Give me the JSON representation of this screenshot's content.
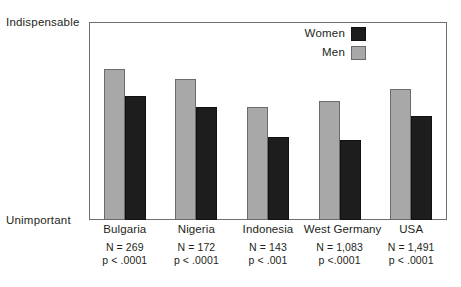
{
  "chart_data": {
    "type": "bar",
    "title": "",
    "xlabel": "",
    "ylabel": "",
    "ylim": [
      0,
      3.0
    ],
    "yticks": [
      "0",
      "0.5",
      "1.0",
      "1.5",
      "2.0",
      "2.5",
      "3.0"
    ],
    "y_axis_top_label": "Indispensable",
    "y_axis_bottom_label": "Unimportant",
    "grid": false,
    "legend_position": "top-right",
    "categories": [
      "Bulgaria",
      "Nigeria",
      "Indonesia",
      "West Germany",
      "USA"
    ],
    "series": [
      {
        "name": "Men",
        "color": "#a8a8a8",
        "values": [
          2.29,
          2.14,
          1.71,
          1.8,
          1.98
        ]
      },
      {
        "name": "Women",
        "color": "#1d1d1d",
        "values": [
          1.88,
          1.71,
          1.26,
          1.21,
          1.58
        ]
      }
    ],
    "annotations": [
      {
        "category": "Bulgaria",
        "n": "N = 269",
        "p": "p < .0001"
      },
      {
        "category": "Nigeria",
        "n": "N = 172",
        "p": "p < .0001"
      },
      {
        "category": "Indonesia",
        "n": "N = 143",
        "p": "p < .001"
      },
      {
        "category": "West Germany",
        "n": "N = 1,083",
        "p": "p <.0001"
      },
      {
        "category": "USA",
        "n": "N = 1,491",
        "p": "p < .0001"
      }
    ]
  },
  "legend": {
    "items": [
      {
        "label": "Women",
        "swatch": "dark-swatch-icon"
      },
      {
        "label": "Men",
        "swatch": "light-swatch-icon"
      }
    ]
  }
}
